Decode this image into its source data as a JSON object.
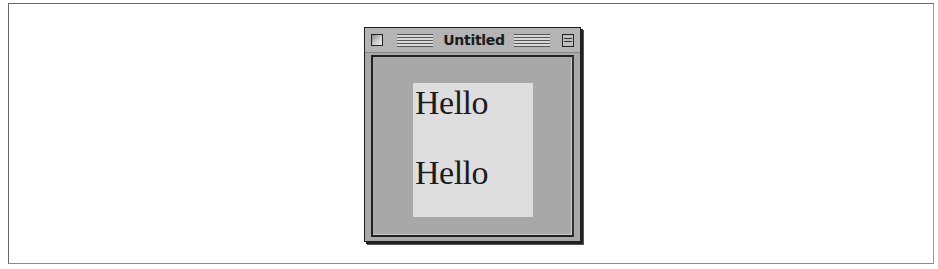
{
  "window": {
    "title": "Untitled",
    "controls": {
      "close_icon": "close-box-icon",
      "zoom_icon": "zoom-box-icon"
    }
  },
  "content": {
    "labels": [
      "Hello",
      "Hello"
    ]
  },
  "colors": {
    "window_bg": "#a9a9a9",
    "titlebar_bg": "#b4b4b4",
    "panel_bg": "#dedede",
    "text": "#1b1b1b"
  }
}
